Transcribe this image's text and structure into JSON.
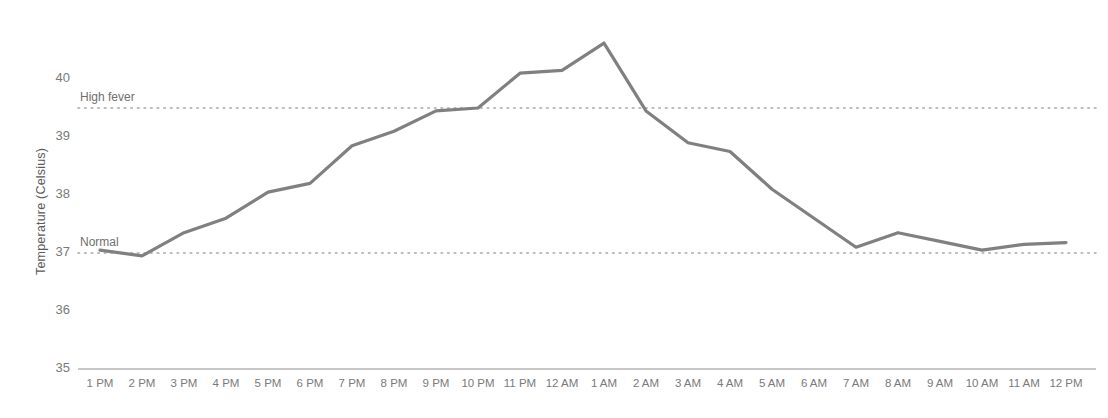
{
  "chart_data": {
    "type": "line",
    "title": "",
    "xlabel": "",
    "ylabel": "Temperature (Celsius)",
    "ylim": [
      35,
      40.8
    ],
    "yticks": [
      35,
      36,
      37,
      38,
      39,
      40
    ],
    "ytick_labels": [
      "35",
      "36",
      "37",
      "38",
      "39",
      "40"
    ],
    "grid": false,
    "legend": "none",
    "categories": [
      "1 PM",
      "2 PM",
      "3 PM",
      "4 PM",
      "5 PM",
      "6 PM",
      "7 PM",
      "8 PM",
      "9 PM",
      "10 PM",
      "11 PM",
      "12 AM",
      "1 AM",
      "2 AM",
      "3 AM",
      "4 AM",
      "5 AM",
      "6 AM",
      "7 AM",
      "8 AM",
      "9 AM",
      "10 AM",
      "11 AM",
      "12 PM"
    ],
    "values": [
      37.05,
      36.95,
      37.35,
      37.6,
      38.05,
      38.2,
      38.85,
      39.1,
      39.45,
      39.5,
      40.1,
      40.15,
      40.62,
      39.45,
      38.9,
      38.75,
      38.1,
      37.6,
      37.1,
      37.35,
      37.2,
      37.05,
      37.15,
      37.18
    ],
    "series_name": "Body temperature",
    "line_color": "#808080",
    "reference_lines": [
      {
        "label": "High fever",
        "value": 39.5,
        "color": "#a8a8a8",
        "style": "dotted"
      },
      {
        "label": "Normal",
        "value": 37.0,
        "color": "#a8a8a8",
        "style": "dotted"
      }
    ],
    "axis_color": "#b5b5b5"
  }
}
